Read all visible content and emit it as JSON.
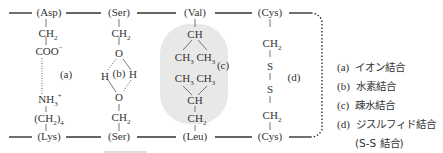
{
  "diagram": {
    "title": "",
    "top_chain": {
      "residues": [
        "(Asp)",
        "(Ser)",
        "(Val)",
        "(Cys)"
      ]
    },
    "bottom_chain": {
      "residues": [
        "(Lys)",
        "(Ser)",
        "(Leu)",
        "(Cys)"
      ]
    },
    "columns": [
      {
        "id": "asp-lys",
        "top_groups": [
          "CH2",
          "COO-"
        ],
        "bottom_groups": [
          "NH3+",
          "(CH2)4"
        ],
        "bond_label": "(a)",
        "bond_type": "dotted"
      },
      {
        "id": "ser-ser",
        "top_groups": [
          "CH2",
          "O"
        ],
        "middle": [
          "H",
          "(b)",
          "H"
        ],
        "bottom_groups": [
          "O",
          "CH2"
        ],
        "bond_label": "(b)",
        "bond_type": "dotted-hydrogen"
      },
      {
        "id": "val-leu",
        "top_groups": [
          "CH",
          "CH3 CH3"
        ],
        "bottom_groups": [
          "CH3 CH3",
          "CH",
          "CH2"
        ],
        "bond_label": "(c)",
        "highlight_color": "#e8e8e8"
      },
      {
        "id": "cys-cys",
        "top_groups": [
          "CH2",
          "S"
        ],
        "bottom_groups": [
          "S",
          "CH2"
        ],
        "bond_label": "(d)",
        "bond_type": "solid"
      }
    ],
    "text": {
      "ch2": "CH",
      "ch3": "CH",
      "ch": "CH",
      "coo": "COO",
      "nh3": "NH",
      "ch2_4_open": "(CH",
      "ch2_4_close": ")",
      "o": "O",
      "h": "H",
      "s": "S",
      "sub2": "2",
      "sub3": "3",
      "sub4": "4",
      "minus": "−",
      "plus": "+",
      "label_a": "(a)",
      "label_b": "(b)",
      "label_c": "(c)",
      "label_d": "(d)"
    }
  },
  "legend": {
    "items": [
      {
        "key": "(a)",
        "label": "イオン結合"
      },
      {
        "key": "(b)",
        "label": "水素結合"
      },
      {
        "key": "(c)",
        "label": "疎水結合"
      },
      {
        "key": "(d)",
        "label": "ジスルフィド結合"
      }
    ],
    "note": "(S-S 結合)"
  },
  "colors": {
    "line": "#333333",
    "highlight": "#e6e6e6",
    "text": "#333333"
  }
}
